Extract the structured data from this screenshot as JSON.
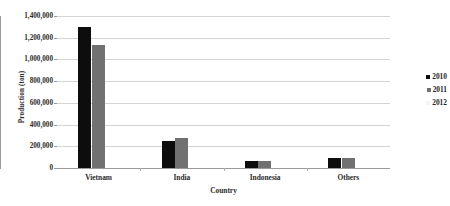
{
  "chart_data": {
    "type": "bar",
    "title": "",
    "xlabel": "Country",
    "ylabel": "Production (ton)",
    "categories": [
      "Vietnam",
      "India",
      "Indonesia",
      "Others"
    ],
    "series": [
      {
        "name": "2010",
        "color": "#0d0d0d",
        "values": [
          1300000,
          250000,
          62000,
          88000
        ]
      },
      {
        "name": "2011",
        "color": "#717171",
        "values": [
          1130000,
          275000,
          62000,
          88000
        ]
      },
      {
        "name": "2012",
        "color": "#f4f4f4",
        "values": [
          0,
          0,
          0,
          0
        ]
      }
    ],
    "ylim": [
      0,
      1400000
    ],
    "ytick_values": [
      0,
      200000,
      400000,
      600000,
      800000,
      1000000,
      1200000,
      1400000
    ],
    "ytick_labels": [
      "0",
      "200,000",
      "400,000",
      "600,000",
      "800,000",
      "1,000,000",
      "1,200,000",
      "1,400,000"
    ],
    "grid": true,
    "legend_position": "right",
    "legend": [
      "2010",
      "2011",
      "2012"
    ]
  }
}
